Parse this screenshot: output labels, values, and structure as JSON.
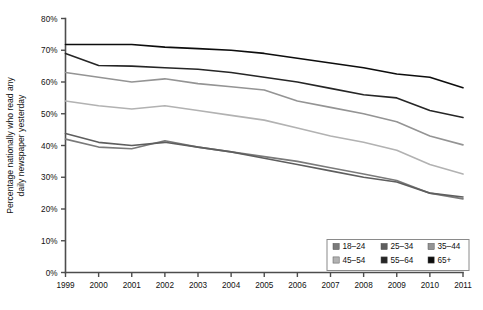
{
  "chart_data": {
    "type": "line",
    "title": "",
    "xlabel": "",
    "ylabel": "Percentage nationally who read any daily newspaper yesterday",
    "x": [
      1999,
      2000,
      2001,
      2002,
      2003,
      2004,
      2005,
      2006,
      2007,
      2008,
      2009,
      2010,
      2011
    ],
    "xtick_labels": [
      "1999",
      "2000",
      "2001",
      "2002",
      "2003",
      "2004",
      "2005",
      "2006",
      "2007",
      "2008",
      "2009",
      "2010",
      "2011"
    ],
    "ytick_labels": [
      "0%",
      "10%",
      "20%",
      "30%",
      "40%",
      "50%",
      "60%",
      "70%",
      "80%"
    ],
    "ytick_values": [
      0,
      10,
      20,
      30,
      40,
      50,
      60,
      70,
      80
    ],
    "ylim": [
      0,
      80
    ],
    "xlim": [
      1999,
      2011
    ],
    "grid": false,
    "legend_position": "bottom-right",
    "series": [
      {
        "name": "18–24",
        "color": "#7a7a7a",
        "values": [
          42.0,
          39.5,
          39.0,
          41.5,
          39.5,
          38.0,
          36.5,
          35.0,
          33.0,
          31.0,
          29.0,
          25.0,
          23.2
        ]
      },
      {
        "name": "25–34",
        "color": "#5e5e5e",
        "values": [
          43.8,
          41.0,
          40.0,
          41.0,
          39.5,
          38.0,
          36.0,
          34.0,
          32.0,
          30.0,
          28.5,
          25.0,
          23.8
        ]
      },
      {
        "name": "35–44",
        "color": "#949494",
        "values": [
          63.0,
          61.5,
          60.0,
          61.0,
          59.5,
          58.5,
          57.5,
          54.0,
          52.0,
          50.0,
          47.5,
          43.0,
          40.2
        ]
      },
      {
        "name": "45–54",
        "color": "#b2b2b2",
        "values": [
          54.0,
          52.5,
          51.5,
          52.5,
          51.0,
          49.5,
          48.0,
          45.5,
          43.0,
          41.0,
          38.5,
          34.0,
          31.0
        ]
      },
      {
        "name": "55–64",
        "color": "#262626",
        "values": [
          69.0,
          65.2,
          65.0,
          64.5,
          64.0,
          63.0,
          61.5,
          60.0,
          58.0,
          56.0,
          55.0,
          51.0,
          48.8
        ]
      },
      {
        "name": "65+",
        "color": "#0d0d0d",
        "values": [
          71.8,
          71.8,
          71.8,
          71.0,
          70.5,
          70.0,
          69.0,
          67.5,
          66.0,
          64.5,
          62.5,
          61.5,
          58.2
        ]
      }
    ],
    "legend_entries": [
      {
        "label": "18–24",
        "color": "#7a7a7a"
      },
      {
        "label": "25–34",
        "color": "#5e5e5e"
      },
      {
        "label": "35–44",
        "color": "#949494"
      },
      {
        "label": "45–54",
        "color": "#b2b2b2"
      },
      {
        "label": "55–64",
        "color": "#262626"
      },
      {
        "label": "65+",
        "color": "#0d0d0d"
      }
    ]
  }
}
